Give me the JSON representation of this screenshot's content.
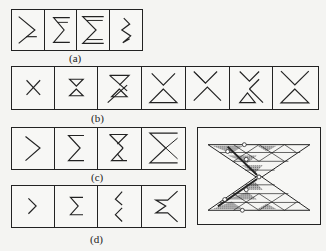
{
  "labels": {
    "a": "(a)",
    "b": "(b)",
    "c": "(c)",
    "d": "(d)"
  },
  "rows": {
    "a": {
      "cell_count": 4,
      "description": "Sigma-shaped fold patterns, increasing complexity"
    },
    "b": {
      "cell_count": 7,
      "description": "X / hourglass crease patterns"
    },
    "c": {
      "cell_count": 4,
      "description": "Sigma variants with triangle"
    },
    "d": {
      "cell_count": 4,
      "description": "Chevron / zigzag variants"
    }
  },
  "panel": {
    "description": "Hourglass lattice of shaded triangles with hinge circles"
  },
  "colors": {
    "line": "#222222",
    "shade": "#9a9a9a",
    "background": "#f4f4f2"
  }
}
